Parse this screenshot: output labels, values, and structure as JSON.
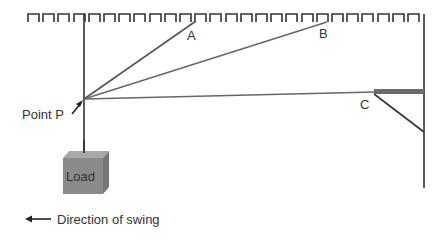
{
  "labels": {
    "point_a": "A",
    "point_b": "B",
    "point_c": "C",
    "point_p": "Point P",
    "load": "Load",
    "direction": "Direction of swing"
  },
  "colors": {
    "line": "#333333",
    "rope": "#555555",
    "bar": "#6b6b6b",
    "load_front": "#8a8a8a",
    "load_top": "#a8a8a8",
    "load_side": "#767676",
    "text": "#333333"
  },
  "geometry": {
    "ceiling": {
      "x_start": 28,
      "x_end": 424,
      "y_top": 14,
      "y_bottom": 22,
      "period": 15.2,
      "tooth_width": 11
    },
    "pole": {
      "x": 84,
      "y_top": 14,
      "y_bottom": 153
    },
    "wall": {
      "x": 424,
      "y_top": 14,
      "y_bottom": 188
    },
    "point_p": {
      "x": 84,
      "y": 99
    },
    "rope_a_end": {
      "x": 196,
      "y": 21
    },
    "rope_b_end": {
      "x": 327,
      "y": 22
    },
    "rope_c_end": {
      "x": 374,
      "y": 92
    }
  }
}
